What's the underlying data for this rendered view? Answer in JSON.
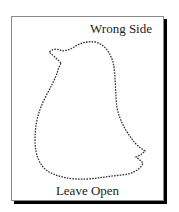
{
  "diagram": {
    "type": "sewing-pattern-piece",
    "shape": "bird-silhouette",
    "labels": {
      "top_right": "Wrong Side",
      "bottom": "Leave Open"
    },
    "style": {
      "frame_border_color": "#8a8a8a",
      "shadow_color": "#000000",
      "outline_color": "#333333",
      "outline_style": "dashed",
      "text_color": "#222222",
      "background": "#ffffff"
    }
  }
}
